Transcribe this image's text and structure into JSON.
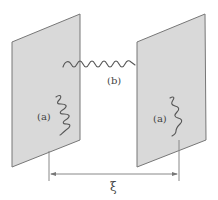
{
  "figure": {
    "labels": {
      "left_mode": "(a)",
      "right_mode": "(a)",
      "gap_mode": "(b)",
      "separation": "ξ"
    },
    "plates": [
      {
        "name": "left-plate",
        "corners": [
          [
            12,
            42
          ],
          [
            80,
            14
          ],
          [
            80,
            140
          ],
          [
            12,
            167
          ]
        ]
      },
      {
        "name": "right-plate",
        "corners": [
          [
            137,
            42
          ],
          [
            205,
            14
          ],
          [
            206,
            140
          ],
          [
            137,
            167
          ]
        ]
      }
    ],
    "colors": {
      "plate_fill": "#d9d9d9",
      "plate_edge": "#777777",
      "wave": "#555555",
      "text": "#444444"
    }
  }
}
